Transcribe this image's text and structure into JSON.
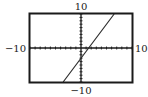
{
  "chart_data": {
    "type": "line",
    "title": "",
    "xlabel": "",
    "ylabel": "",
    "xlim": [
      -10,
      10
    ],
    "ylim": [
      -10,
      10
    ],
    "xscale": 1,
    "yscale": 1,
    "grid": false,
    "legend": null,
    "tick_labels": {
      "xmin": "−10",
      "xmax": "10",
      "ymin": "−10",
      "ymax": "10"
    },
    "series": [
      {
        "name": "y = 2x − 3",
        "equation": "y = 2x - 3",
        "slope": 2,
        "intercept": -3,
        "x": [
          -3.5,
          6.5
        ],
        "values": [
          -10,
          10
        ]
      }
    ]
  },
  "colors": {
    "frame": "#1a1a1a",
    "axis": "#1a1a1a",
    "line": "#2a2a2a",
    "background": "#ffffff"
  }
}
